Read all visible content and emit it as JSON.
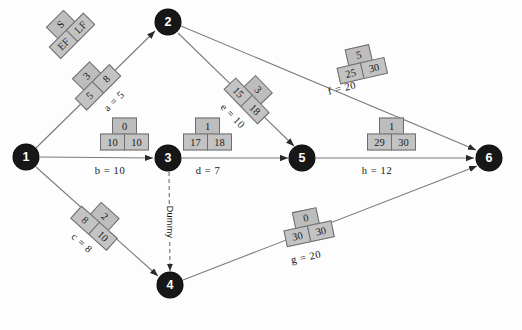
{
  "diagram": {
    "type": "pert-cpm-network",
    "title": "",
    "background_color": "#fdfdfd",
    "node_color": "#171717",
    "box_fill": "#c3c3c3",
    "box_border": "#6d6d6d",
    "line_color": "#6e6e6e"
  },
  "legend": {
    "name": "legend-box",
    "slack": "S",
    "ef": "EF",
    "lf": "LF",
    "rotation": -45
  },
  "nodes": [
    {
      "id": "1",
      "label": "1",
      "x": 26,
      "y": 157
    },
    {
      "id": "2",
      "label": "2",
      "x": 168,
      "y": 22
    },
    {
      "id": "3",
      "label": "3",
      "x": 168,
      "y": 158
    },
    {
      "id": "4",
      "label": "4",
      "x": 170,
      "y": 285
    },
    {
      "id": "5",
      "label": "5",
      "x": 302,
      "y": 158
    },
    {
      "id": "6",
      "label": "6",
      "x": 489,
      "y": 158
    }
  ],
  "activities": [
    {
      "key": "a",
      "label": "a = 5",
      "duration": "5",
      "from": "1",
      "to": "2",
      "slack": "3",
      "ef": "5",
      "lf": "8",
      "box_x": 92,
      "box_y": 82,
      "box_rotation": -45,
      "label_x": 114,
      "label_y": 101,
      "label_rotation": -44
    },
    {
      "key": "b",
      "label": "b = 10",
      "duration": "10",
      "from": "1",
      "to": "3",
      "slack": "0",
      "ef": "10",
      "lf": "10",
      "box_x": 124,
      "box_y": 134,
      "box_rotation": 0,
      "label_x": 110,
      "label_y": 170,
      "label_rotation": 0
    },
    {
      "key": "c",
      "label": "c = 8",
      "duration": "8",
      "from": "1",
      "to": "4",
      "slack": "2",
      "ef": "8",
      "lf": "10",
      "box_x": 99,
      "box_y": 222,
      "box_rotation": 42,
      "label_x": 82,
      "label_y": 243,
      "label_rotation": 42
    },
    {
      "key": "d",
      "label": "d = 7",
      "duration": "7",
      "from": "3",
      "to": "5",
      "slack": "1",
      "ef": "17",
      "lf": "18",
      "box_x": 207,
      "box_y": 134,
      "box_rotation": 0,
      "label_x": 208,
      "label_y": 170,
      "label_rotation": 0
    },
    {
      "key": "e",
      "label": "e = 10",
      "duration": "10",
      "from": "2",
      "to": "5",
      "slack": "3",
      "ef": "15",
      "lf": "18",
      "box_x": 252,
      "box_y": 95,
      "box_rotation": 46,
      "label_x": 233,
      "label_y": 116,
      "label_rotation": 46
    },
    {
      "key": "f",
      "label": "f = 20",
      "duration": "20",
      "from": "2",
      "to": "6",
      "slack": "5",
      "ef": "25",
      "lf": "30",
      "box_x": 360,
      "box_y": 63,
      "box_rotation": -13,
      "label_x": 342,
      "label_y": 88,
      "label_rotation": -13
    },
    {
      "key": "g",
      "label": "g = 20",
      "duration": "20",
      "from": "4",
      "to": "6",
      "slack": "0",
      "ef": "30",
      "lf": "30",
      "box_x": 307,
      "box_y": 226,
      "box_rotation": -12,
      "label_x": 306,
      "label_y": 257,
      "label_rotation": -12
    },
    {
      "key": "h",
      "label": "h = 12",
      "duration": "12",
      "from": "5",
      "to": "6",
      "slack": "1",
      "ef": "29",
      "lf": "30",
      "box_x": 391,
      "box_y": 134,
      "box_rotation": 0,
      "label_x": 377,
      "label_y": 170,
      "label_rotation": 0
    }
  ],
  "dummy": {
    "label": "Dummy",
    "from": "3",
    "to": "4",
    "style": "dashed",
    "label_x": 170,
    "label_y": 222,
    "rotation": 90
  }
}
